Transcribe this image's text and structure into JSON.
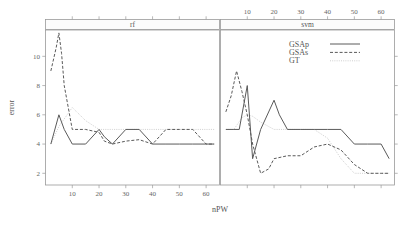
{
  "figure": {
    "kind": "trellis-line-chart",
    "background": "#ffffff",
    "line_color": "#5a5a5a",
    "gt_color": "#c9c9c9",
    "frame_color": "#9a9a9a"
  },
  "axis": {
    "xlabel": "nPW",
    "ylabel": "error",
    "x_ticks": [
      "10",
      "20",
      "30",
      "40",
      "50",
      "60"
    ],
    "y_ticks": [
      "2",
      "4",
      "6",
      "8",
      "10"
    ],
    "xlim": [
      0,
      65
    ],
    "ylim": [
      1.2,
      11.8
    ]
  },
  "panels": [
    {
      "strip_label": "rf"
    },
    {
      "strip_label": "svm"
    }
  ],
  "legend": {
    "items": [
      {
        "label": "GSAp",
        "style": "solid"
      },
      {
        "label": "GSAs",
        "style": "dashed"
      },
      {
        "label": "GT",
        "style": "dotted"
      }
    ]
  },
  "chart_data": {
    "type": "line",
    "title": "",
    "xlabel": "nPW",
    "ylabel": "error",
    "xlim": [
      0,
      65
    ],
    "ylim": [
      1.2,
      11.8
    ],
    "grid": false,
    "legend_position": "top-right-of-second-panel",
    "panels": [
      {
        "name": "rf",
        "series": [
          {
            "name": "GSAp",
            "style": "solid",
            "x": [
              2,
              5,
              7,
              10,
              15,
              20,
              22,
              25,
              30,
              35,
              40,
              45,
              50,
              55,
              60,
              63
            ],
            "y": [
              4,
              6,
              5,
              4,
              4,
              5,
              4.5,
              4,
              5,
              5,
              4,
              4,
              4,
              4,
              4,
              4
            ]
          },
          {
            "name": "GSAs",
            "style": "dashed",
            "x": [
              2,
              4,
              5,
              6,
              7,
              10,
              15,
              20,
              22,
              25,
              30,
              35,
              40,
              45,
              50,
              55,
              60,
              63
            ],
            "y": [
              9,
              10.6,
              11.6,
              10.2,
              8,
              5,
              5,
              4.8,
              4.2,
              4,
              4.2,
              4.3,
              4,
              5,
              5,
              5,
              4,
              4
            ]
          },
          {
            "name": "GT",
            "style": "dotted",
            "x": [
              2,
              5,
              10,
              15,
              20,
              25,
              30,
              35,
              40,
              45,
              50,
              55,
              60,
              63
            ],
            "y": [
              4,
              5.2,
              6.5,
              5.6,
              5,
              5,
              5,
              5,
              5,
              5,
              5,
              5,
              5,
              5
            ]
          }
        ]
      },
      {
        "name": "svm",
        "series": [
          {
            "name": "GSAp",
            "style": "solid",
            "x": [
              2,
              5,
              7,
              10,
              12,
              15,
              20,
              22,
              25,
              30,
              35,
              40,
              45,
              50,
              55,
              60,
              63
            ],
            "y": [
              5,
              5,
              5,
              8,
              3,
              5,
              7,
              6,
              5,
              5,
              5,
              5,
              5,
              4,
              4,
              4,
              3
            ]
          },
          {
            "name": "GSAs",
            "style": "dashed",
            "x": [
              2,
              4,
              6,
              8,
              10,
              12,
              15,
              18,
              20,
              25,
              30,
              35,
              40,
              45,
              50,
              55,
              60,
              63
            ],
            "y": [
              6.2,
              7.3,
              9,
              7.6,
              6,
              4,
              2,
              2.3,
              3,
              3.2,
              3.2,
              3.8,
              4,
              3.6,
              2.6,
              2,
              2,
              2
            ]
          },
          {
            "name": "GT",
            "style": "dotted",
            "x": [
              2,
              5,
              8,
              10,
              12,
              15,
              20,
              25,
              30,
              35,
              40,
              45,
              50,
              55,
              60,
              63
            ],
            "y": [
              5,
              5,
              5.8,
              6,
              5.9,
              5.5,
              5,
              5,
              5,
              5,
              4.4,
              3,
              2,
              2,
              2,
              2
            ]
          }
        ]
      }
    ]
  }
}
